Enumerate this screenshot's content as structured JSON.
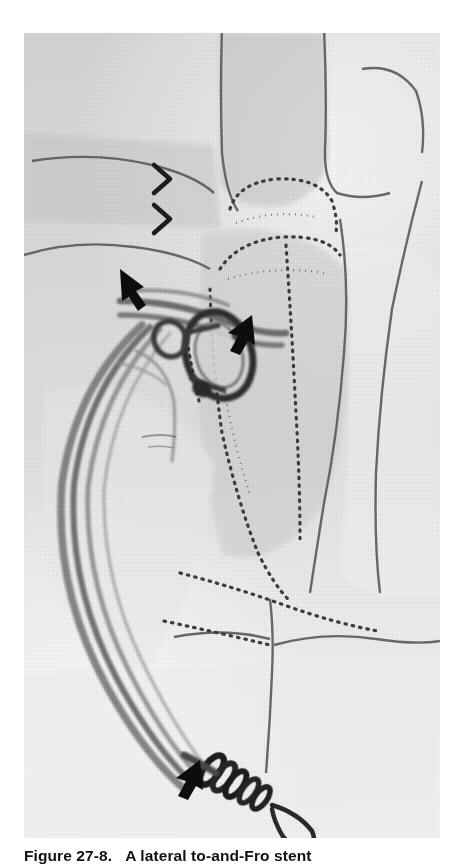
{
  "page": {
    "background_color": "#ffffff",
    "type": "textbook-figure-page"
  },
  "figure": {
    "image": {
      "kind": "grayscale-angiographic-illustration",
      "description": "Lateral grayscale radiographic illustration of the abdominal aorta and visceral branches with an endovascular stent graft in place and catheter tubing exiting inferiorly",
      "background_color": "#dcdcdc",
      "ink_color": "#4a4a4a",
      "marker_color": "#111111",
      "frame": {
        "x": 24,
        "y": 33,
        "width": 416,
        "height": 805
      }
    },
    "markers": [
      {
        "name": "chevron-marker-upper",
        "glyph": ">",
        "x": 158,
        "y": 172
      },
      {
        "name": "chevron-marker-lower",
        "glyph": ">",
        "x": 158,
        "y": 212
      },
      {
        "name": "arrow-marker-stent-superior",
        "glyph": "↓",
        "x": 130,
        "y": 288
      },
      {
        "name": "arrow-marker-stent-inferior",
        "glyph": "←",
        "x": 205,
        "y": 338
      },
      {
        "name": "arrow-marker-catheter-tip",
        "glyph": "↖",
        "x": 178,
        "y": 768
      }
    ],
    "caption": {
      "label": "Figure 27-8.",
      "text": "A lateral to-and-Fro stent"
    }
  }
}
